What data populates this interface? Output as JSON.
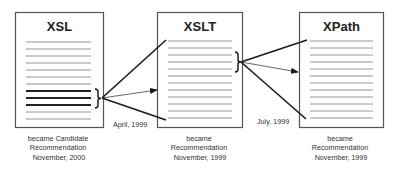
{
  "documents": [
    {
      "id": "xsl",
      "title": "XSL",
      "box": {
        "x": 15.5,
        "y": 12.5,
        "w": 88,
        "h": 115
      },
      "lines": {
        "x1": 26,
        "x2": 91,
        "y_start": 42,
        "step": 7,
        "count": 12,
        "thick_indices": [
          7,
          8,
          9
        ]
      },
      "caption": [
        "became Candidate",
        "Recommendation",
        "November, 2000"
      ],
      "caption_x": 59
    },
    {
      "id": "xslt",
      "title": "XSLT",
      "box": {
        "x": 157.5,
        "y": 12.5,
        "w": 85,
        "h": 115
      },
      "lines": {
        "x1": 168,
        "x2": 232,
        "y_start": 41,
        "step": 7,
        "count": 12,
        "thick_indices": []
      },
      "caption": [
        "became",
        "Recommendation",
        "November, 1999"
      ],
      "caption_x": 200
    },
    {
      "id": "xpath",
      "title": "XPath",
      "box": {
        "x": 299.5,
        "y": 12.5,
        "w": 84,
        "h": 115
      },
      "lines": {
        "x1": 310,
        "x2": 373,
        "y_start": 41,
        "step": 7,
        "count": 12,
        "thick_indices": []
      },
      "caption": [
        "became",
        "Recommendation",
        "November, 1999"
      ],
      "caption_x": 341
    }
  ],
  "connections": [
    {
      "from": "xsl",
      "to": "xslt",
      "date_label": "April, 1999",
      "label_pos": {
        "x": 113,
        "y": 127
      },
      "bracket": {
        "x": 95,
        "y1": 89,
        "y2": 108
      },
      "origin": {
        "x": 102,
        "y": 98
      },
      "lines": [
        {
          "x2": 166,
          "y2": 40,
          "arrow": false
        },
        {
          "x2": 157,
          "y2": 90,
          "arrow": true
        },
        {
          "x2": 166,
          "y2": 120,
          "arrow": false
        }
      ]
    },
    {
      "from": "xslt",
      "to": "xpath",
      "date_label": "July, 1999",
      "label_pos": {
        "x": 257,
        "y": 124
      },
      "bracket": {
        "x": 235,
        "y1": 52,
        "y2": 72
      },
      "origin": {
        "x": 241,
        "y": 62
      },
      "lines": [
        {
          "x2": 307,
          "y2": 40,
          "arrow": false
        },
        {
          "x2": 298,
          "y2": 72,
          "arrow": true
        },
        {
          "x2": 306,
          "y2": 119,
          "arrow": false
        }
      ]
    }
  ],
  "colors": {
    "box_border": "#555555",
    "thin_line": "#8a8a8a",
    "thick_line": "#222222",
    "connector": "#1a1a1a",
    "arrow_line": "#555555"
  }
}
